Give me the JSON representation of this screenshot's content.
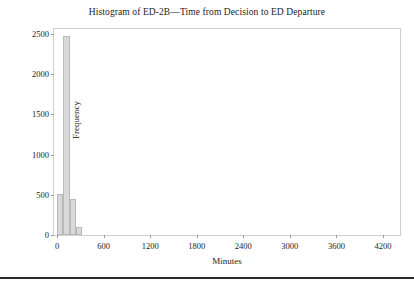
{
  "chart_data": {
    "type": "bar",
    "title": "Histogram of ED-2B—Time from Decision to ED Departure",
    "xlabel": "Minutes",
    "ylabel": "Frequency",
    "grid": false,
    "legend": null,
    "bin_width": 80,
    "xlim": [
      -40,
      4420
    ],
    "ylim": [
      0,
      2560
    ],
    "x_ticks": [
      0,
      600,
      1200,
      1800,
      2400,
      3000,
      3600,
      4200
    ],
    "x_tick_labels": [
      "0",
      "600",
      "1200",
      "1800",
      "2400",
      "3000",
      "3600",
      "4200"
    ],
    "y_ticks": [
      0,
      500,
      1000,
      1500,
      2000,
      2500
    ],
    "y_tick_labels": [
      "0",
      "500",
      "1000",
      "1500",
      "2000",
      "2500"
    ],
    "bins": [
      {
        "start": 0,
        "end": 80,
        "value": 510
      },
      {
        "start": 80,
        "end": 160,
        "value": 2470
      },
      {
        "start": 160,
        "end": 240,
        "value": 450
      },
      {
        "start": 240,
        "end": 320,
        "value": 100
      }
    ],
    "bar_fill_color": "#d9d9d9",
    "bar_edge_color": "#b9b9b9",
    "frame_color": "#cfcfcf",
    "text_color": "#1c1c1c"
  }
}
